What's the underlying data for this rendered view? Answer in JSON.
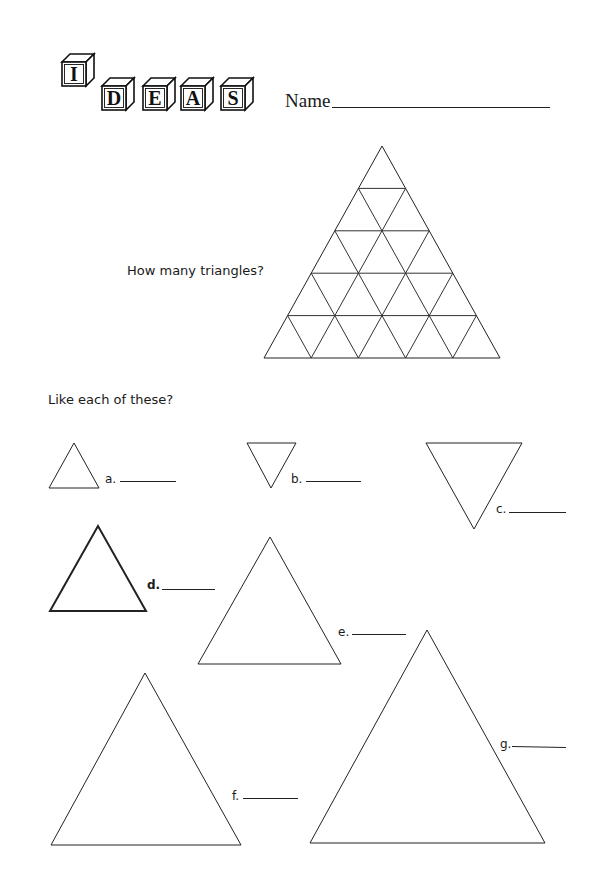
{
  "header": {
    "logo_letters": [
      "I",
      "D",
      "E",
      "A",
      "S"
    ],
    "name_label": "Name"
  },
  "puzzle": {
    "question": "How many triangles?",
    "grid_rows": 5
  },
  "exercise": {
    "prompt": "Like each of these?",
    "items": [
      {
        "label": "a.",
        "orientation": "up",
        "bold": false
      },
      {
        "label": "b.",
        "orientation": "down",
        "bold": false
      },
      {
        "label": "c.",
        "orientation": "down",
        "bold": false
      },
      {
        "label": "d.",
        "orientation": "up",
        "bold": true
      },
      {
        "label": "e.",
        "orientation": "up",
        "bold": false
      },
      {
        "label": "f.",
        "orientation": "up",
        "bold": false
      },
      {
        "label": "g.",
        "orientation": "up",
        "bold": false
      }
    ]
  }
}
